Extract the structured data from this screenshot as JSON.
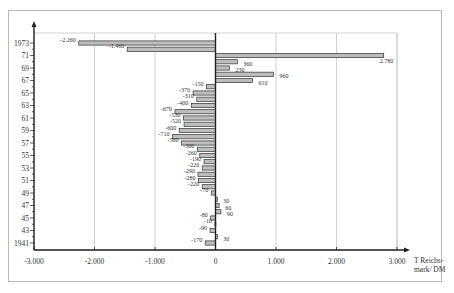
{
  "chart_data": {
    "type": "bar",
    "orientation": "horizontal",
    "title": "",
    "xlabel": "T Reichs-mark/ DM",
    "xlabel_lines": [
      "T Reichs-",
      "mark/ DM"
    ],
    "ylabel": "",
    "xlim": [
      -3000,
      3000
    ],
    "x_ticks": [
      -3000,
      -2000,
      -1000,
      0,
      1000,
      2000,
      3000
    ],
    "x_tick_labels": [
      "-3.000",
      "-2.000",
      "-1.000",
      "0",
      "1.000",
      "2.000",
      "3.000"
    ],
    "y_tick_labels": [
      "1973",
      "71",
      "69",
      "67",
      "65",
      "63",
      "61",
      "59",
      "57",
      "55",
      "53",
      "51",
      "49",
      "47",
      "45",
      "43",
      "1941"
    ],
    "grid": {
      "vertical": true,
      "horizontal": false
    },
    "legend": null,
    "bar_fill": "#bdbdbd",
    "bar_stroke": "#333333",
    "categories": [
      1973,
      1972,
      1971,
      1970,
      1969,
      1968,
      1967,
      1966,
      1965,
      1964,
      1963,
      1962,
      1961,
      1960,
      1959,
      1958,
      1957,
      1956,
      1955,
      1954,
      1953,
      1952,
      1951,
      1950,
      1949,
      1948,
      1947,
      1946,
      1945,
      1944,
      1943,
      1942,
      1941
    ],
    "values": [
      -2260,
      -1460,
      2780,
      360,
      230,
      960,
      610,
      -150,
      -370,
      -310,
      -400,
      -670,
      -530,
      -520,
      -600,
      -710,
      -560,
      -300,
      -260,
      -190,
      -220,
      -290,
      -280,
      -220,
      -70,
      30,
      60,
      90,
      -80,
      -10,
      -90,
      30,
      -170
    ],
    "value_labels": [
      "-2.260",
      "-1.460",
      "2.780",
      "360",
      "230",
      "960",
      "610",
      "-150",
      "-370",
      "-310",
      "-400",
      "-670",
      "-530",
      "-520",
      "-600",
      "-710",
      "-560",
      "-300",
      "-260",
      "-190",
      "-220",
      "-290",
      "-280",
      "-220",
      "-70",
      "30",
      "60",
      "90",
      "-80",
      "-10",
      "-90",
      "30",
      "-170"
    ]
  }
}
